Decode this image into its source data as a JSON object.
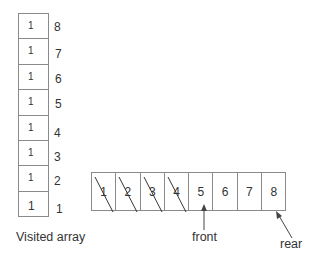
{
  "visited_array": {
    "label": "Visited array",
    "cells": [
      {
        "index": "8",
        "value": "1"
      },
      {
        "index": "7",
        "value": "1"
      },
      {
        "index": "6",
        "value": "1"
      },
      {
        "index": "5",
        "value": "1"
      },
      {
        "index": "4",
        "value": "1"
      },
      {
        "index": "3",
        "value": "1"
      },
      {
        "index": "2",
        "value": "1"
      },
      {
        "index": "1",
        "value": "1"
      }
    ]
  },
  "queue": {
    "cells": [
      {
        "value": "1",
        "dequeued": true
      },
      {
        "value": "2",
        "dequeued": true
      },
      {
        "value": "3",
        "dequeued": true
      },
      {
        "value": "4",
        "dequeued": true
      },
      {
        "value": "5",
        "dequeued": false
      },
      {
        "value": "6",
        "dequeued": false
      },
      {
        "value": "7",
        "dequeued": false
      },
      {
        "value": "8",
        "dequeued": false
      }
    ],
    "front_label": "front",
    "rear_label": "rear"
  },
  "colors": {
    "border": "#8a8a8a",
    "text": "#333333",
    "strike": "#333333"
  }
}
